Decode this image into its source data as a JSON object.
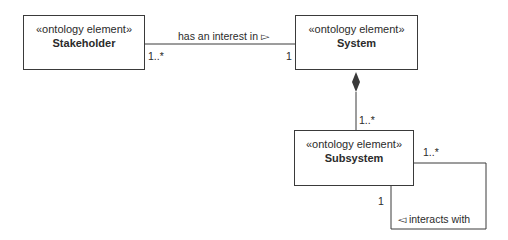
{
  "diagram": {
    "elements": [
      {
        "id": "stakeholder",
        "stereotype": "«ontology element»",
        "name": "Stakeholder"
      },
      {
        "id": "system",
        "stereotype": "«ontology element»",
        "name": "System"
      },
      {
        "id": "subsystem",
        "stereotype": "«ontology element»",
        "name": "Subsystem"
      }
    ],
    "relationships": [
      {
        "id": "interest",
        "from": "Stakeholder",
        "to": "System",
        "type": "association",
        "label": "has an interest in ▻",
        "source_multiplicity": "1..*",
        "target_multiplicity": "1"
      },
      {
        "id": "composition",
        "from": "System",
        "to": "Subsystem",
        "type": "composition",
        "target_multiplicity": "1..*"
      },
      {
        "id": "interacts",
        "from": "Subsystem",
        "to": "Subsystem",
        "type": "association",
        "label": "◅ interacts with",
        "source_multiplicity": "1",
        "target_multiplicity": "1..*"
      }
    ],
    "line_color": "#3a3a3a"
  }
}
